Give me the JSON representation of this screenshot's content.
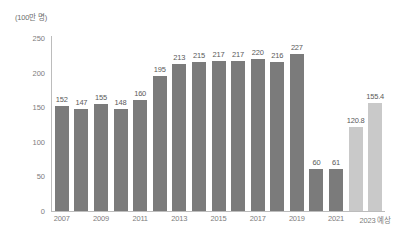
{
  "chart_data": {
    "type": "bar",
    "title": "",
    "subtitle": "",
    "unit_label": "(100만 명)",
    "xlabel": "",
    "ylabel": "",
    "ylim": [
      0,
      250
    ],
    "yticks": [
      0,
      50,
      100,
      150,
      200,
      250
    ],
    "grid": false,
    "legend": "none",
    "categories": [
      "2007",
      "2008",
      "2009",
      "2010",
      "2011",
      "2012",
      "2013",
      "2014",
      "2015",
      "2016",
      "2017",
      "2018",
      "2019",
      "2020",
      "2021",
      "2022",
      "2023 예상"
    ],
    "tick_labels": [
      "2007",
      "",
      "2009",
      "",
      "2011",
      "",
      "2013",
      "",
      "2015",
      "",
      "2017",
      "",
      "2019",
      "",
      "2021",
      "",
      "2023 예상"
    ],
    "values": [
      152,
      147,
      155,
      148,
      160,
      195,
      213,
      215,
      217,
      217,
      220,
      216,
      227,
      60,
      61,
      120.8,
      155.4
    ],
    "value_labels": [
      "152",
      "147",
      "155",
      "148",
      "160",
      "195",
      "213",
      "215",
      "217",
      "217",
      "220",
      "216",
      "227",
      "60",
      "61",
      "120.8",
      "155.4"
    ],
    "bar_styles": [
      "dark",
      "dark",
      "dark",
      "dark",
      "dark",
      "dark",
      "dark",
      "dark",
      "dark",
      "dark",
      "dark",
      "dark",
      "dark",
      "dark",
      "dark",
      "light",
      "light"
    ],
    "colors": {
      "bar_dark": "#7b7b7b",
      "bar_light": "#c9c9c9",
      "axis": "#bcbcbc",
      "tick_text": "#7d7d7d",
      "value_text": "#5a5a5a",
      "background": "#ffffff"
    }
  }
}
